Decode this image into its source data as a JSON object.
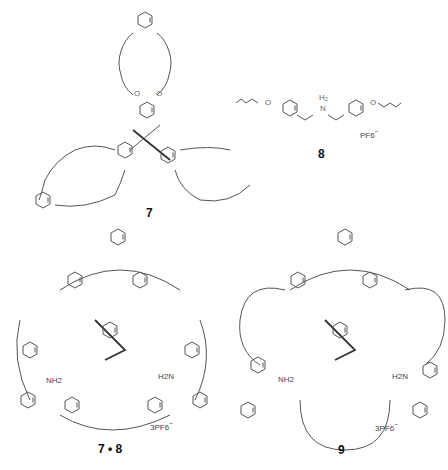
{
  "figure": {
    "compounds": [
      {
        "id": "7",
        "label": "7",
        "description": "tris(dibenzo-24-crown-8) triptycene host"
      },
      {
        "id": "8",
        "label": "8",
        "description": "bis(butenyloxybenzyl)ammonium guest",
        "counterion": "PF6",
        "counterion_charge": "−",
        "ammonium": "H2N+"
      },
      {
        "id": "7-8",
        "label": "7 • 8",
        "counterion": "3PF6",
        "counterion_charge": "−",
        "ammonium_labels": [
          "NH2",
          "NH2",
          "H2N"
        ]
      },
      {
        "id": "9",
        "label": "9",
        "counterion": "3PF6",
        "counterion_charge": "−",
        "ammonium_labels": [
          "NH2",
          "NH2",
          "H2N"
        ]
      }
    ],
    "atom_label": "O"
  }
}
